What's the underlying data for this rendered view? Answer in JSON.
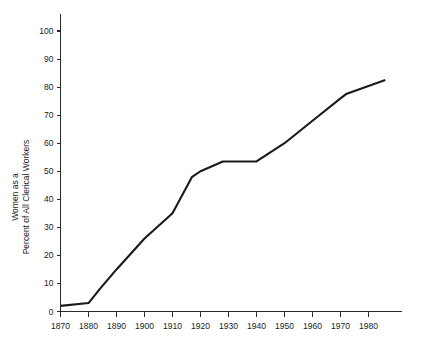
{
  "chart_data": {
    "type": "line",
    "title": "",
    "subtitle": "",
    "xlabel": "",
    "ylabel": "Women as a\nPercent of All Clerical Workers",
    "ylabel_line1": "Women as a",
    "ylabel_line2": "Percent of All Clerical Workers",
    "xlim": [
      1870,
      1990
    ],
    "ylim": [
      0,
      100
    ],
    "grid": false,
    "legend": false,
    "legend_position": "none",
    "line_color": "#1a1a1a",
    "axis_color": "#2a2a2a",
    "background_color": "#ffffff",
    "xticks": [
      1870,
      1880,
      1890,
      1900,
      1910,
      1920,
      1930,
      1940,
      1950,
      1960,
      1970,
      1980
    ],
    "xtick_labels": [
      "1870",
      "1880",
      "1890",
      "1900",
      "1910",
      "1920",
      "1930",
      "1940",
      "1950",
      "1960",
      "1970",
      "1980"
    ],
    "yticks": [
      0,
      10,
      20,
      30,
      40,
      50,
      60,
      70,
      80,
      90,
      100
    ],
    "ytick_labels": [
      "0",
      "10",
      "20",
      "30",
      "40",
      "50",
      "60",
      "70",
      "80",
      "90",
      "100"
    ],
    "series": [
      {
        "name": "Women as a Percent of All Clerical Workers",
        "x": [
          1870,
          1880,
          1884,
          1890,
          1900,
          1910,
          1917,
          1920,
          1928,
          1940,
          1950,
          1960,
          1970,
          1972,
          1986
        ],
        "values": [
          2.0,
          3.0,
          8.0,
          15.0,
          26.0,
          35.0,
          48.0,
          50.0,
          53.5,
          53.5,
          60.0,
          68.0,
          76.0,
          77.5,
          82.5
        ]
      }
    ],
    "annotations": []
  }
}
